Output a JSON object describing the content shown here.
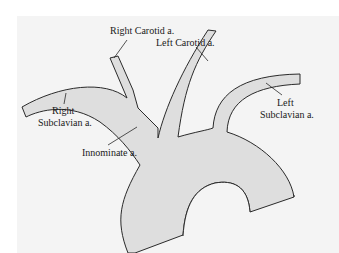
{
  "figure": {
    "type": "anatomical-diagram",
    "colors": {
      "background": "#ffffff",
      "panel": "#f4f4f4",
      "vessel_fill": "#dedede",
      "outline": "#2a2a2a",
      "text": "#1a1a1a"
    },
    "labels": {
      "right_carotid": "Right Carotid a.",
      "left_carotid": "Left Carotid a.",
      "right_subclavian_line1": "Right",
      "right_subclavian_line2": "Subclavian a.",
      "left_subclavian_line1": "Left",
      "left_subclavian_line2": "Subclavian a.",
      "innominate": "Innominate a."
    }
  }
}
